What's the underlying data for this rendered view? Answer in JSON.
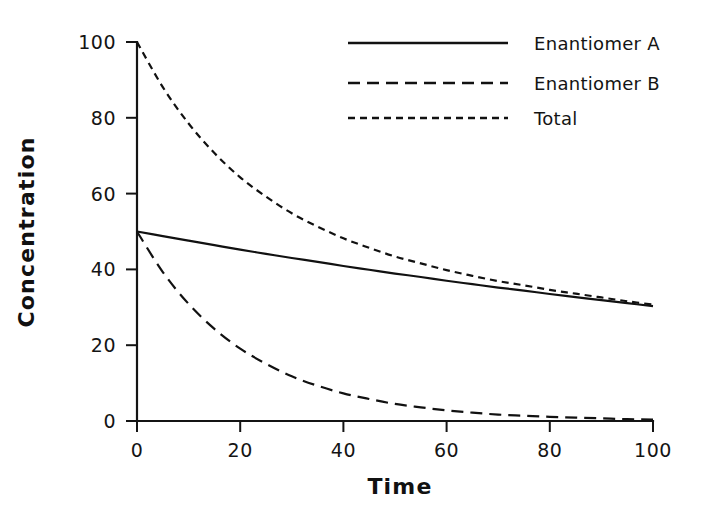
{
  "chart_data": {
    "type": "line",
    "title": "",
    "subtitle": "",
    "xlabel": "Time",
    "ylabel": "Concentration",
    "xlim": [
      0,
      100
    ],
    "ylim": [
      0,
      100
    ],
    "xticks": [
      0,
      20,
      40,
      60,
      80,
      100
    ],
    "yticks": [
      0,
      20,
      40,
      60,
      80,
      100
    ],
    "xtick_labels": [
      "0",
      "20",
      "40",
      "60",
      "80",
      "100"
    ],
    "ytick_labels": [
      "0",
      "20",
      "40",
      "60",
      "80",
      "100"
    ],
    "grid": false,
    "legend_position": "top-right",
    "background": "#ffffff",
    "line_color": "#111111",
    "x": [
      0,
      5,
      10,
      15,
      20,
      25,
      30,
      35,
      40,
      45,
      50,
      55,
      60,
      65,
      70,
      75,
      80,
      85,
      90,
      95,
      100
    ],
    "series": [
      {
        "name": "Enantiomer A",
        "style": "solid",
        "dash": "none",
        "color": "#111111",
        "values": [
          50.0,
          48.8,
          47.6,
          46.4,
          45.2,
          44.1,
          43.0,
          42.0,
          40.9,
          39.9,
          38.9,
          38.0,
          37.0,
          36.1,
          35.2,
          34.4,
          33.5,
          32.7,
          31.9,
          31.1,
          30.3
        ]
      },
      {
        "name": "Enantiomer B",
        "style": "long-dash",
        "dash": "12,7",
        "color": "#111111",
        "values": [
          50.0,
          39.3,
          30.9,
          24.3,
          19.1,
          15.1,
          11.8,
          9.3,
          7.3,
          5.8,
          4.5,
          3.6,
          2.8,
          2.2,
          1.7,
          1.4,
          1.1,
          0.9,
          0.7,
          0.5,
          0.4
        ]
      },
      {
        "name": "Total",
        "style": "short-dash",
        "dash": "7,5",
        "color": "#111111",
        "values": [
          100.0,
          88.1,
          78.5,
          70.7,
          64.3,
          59.2,
          54.8,
          51.3,
          48.2,
          45.7,
          43.4,
          41.6,
          39.8,
          38.3,
          36.9,
          35.8,
          34.6,
          33.6,
          32.6,
          31.6,
          30.7
        ]
      }
    ]
  },
  "legend": {
    "entries": [
      {
        "label": "Enantiomer A",
        "style": "solid"
      },
      {
        "label": "Enantiomer B",
        "style": "long-dash"
      },
      {
        "label": "Total",
        "style": "short-dash"
      }
    ]
  }
}
